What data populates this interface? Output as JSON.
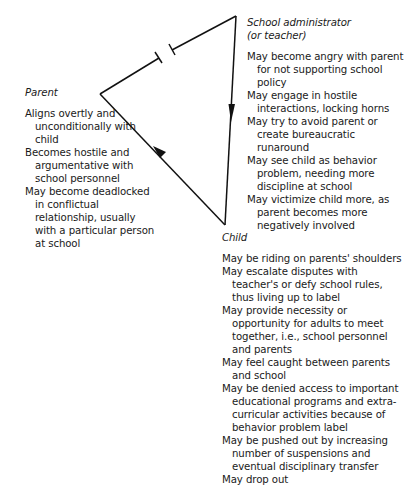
{
  "diagram": {
    "type": "family-school triangle",
    "nodes": {
      "school": {
        "title": "School administrator\n(or teacher)",
        "items": [
          "May become angry with parent for not supporting school policy",
          "May engage in hostile interactions, locking horns",
          "May try to avoid parent or create bureaucratic runaround",
          "May see child as behavior problem, needing more discipline at school",
          "May victimize child more, as parent becomes more negatively involved"
        ]
      },
      "parent": {
        "title": "Parent",
        "items": [
          "Aligns overtly and unconditionally with child",
          "Becomes hostile and argumentative with school personnel",
          "May become deadlocked in conflictual relationship, usually with a particular person at school"
        ]
      },
      "child": {
        "title": "Child",
        "items": [
          "May be riding on parents' shoulders",
          "May escalate disputes with teacher's or defy school rules, thus living up to label",
          "May provide necessity or opportunity for adults to meet together, i.e., school personnel and parents",
          "May feel caught between parents and school",
          "May be denied access to important educational programs and extra-curricular activities because of behavior problem label",
          "May be pushed out by increasing number of suspensions and eventual disciplinary transfer",
          "May drop out"
        ]
      }
    },
    "edges": [
      {
        "from": "parent",
        "to": "school",
        "style": "broken (conflict)",
        "icon": "break-bar-icon"
      },
      {
        "from": "school",
        "to": "child",
        "style": "arrow",
        "icon": "arrow-down-icon"
      },
      {
        "from": "child",
        "to": "parent",
        "style": "arrow",
        "icon": "arrow-up-left-icon"
      }
    ],
    "colors": {
      "line": "#111111",
      "text": "#1a1a1a",
      "background": "#ffffff"
    }
  }
}
